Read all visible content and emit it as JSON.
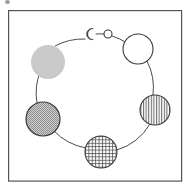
{
  "figure": {
    "background_color": "#ffffff",
    "ink_color": "#3a3a3a",
    "frame": {
      "label": "figure-border",
      "x": 8,
      "y": 10,
      "width": 174,
      "height": 172,
      "stroke": "#555555",
      "stroke_width": 1.2,
      "fill": "none"
    },
    "speck": {
      "label": "scan-artifact-speck",
      "color": "#8a8a8a"
    },
    "ring": {
      "label": "cycle-path",
      "center_x": 95,
      "center_y": 97,
      "radius": 58,
      "stroke": "#4a4a4a",
      "stroke_width": 1.0,
      "fill": "none"
    },
    "patterns": {
      "solid_gray": "#c9c9c9",
      "open_white": "#ffffff",
      "vertical_hatch": "#ffffff",
      "grid_hatch": "#ffffff",
      "fine_checker": "#b0b0b0"
    },
    "nodes": [
      {
        "id": "node-crescent",
        "label": "crescent",
        "fill_style": "crescent",
        "cx": 90,
        "cy": 34,
        "r": 5,
        "angle_deg": 264,
        "stroke": "#3a3a3a",
        "fill": "#ffffff"
      },
      {
        "id": "node-tiny-open",
        "label": "tiny-open-circle",
        "fill_style": "open_white",
        "cx": 108,
        "cy": 34,
        "r": 4,
        "angle_deg": 283,
        "stroke": "#3a3a3a",
        "fill": "#ffffff"
      },
      {
        "id": "node-large-open",
        "label": "large-open-circle",
        "fill_style": "open_white",
        "cx": 138,
        "cy": 49,
        "r": 15,
        "angle_deg": 318,
        "stroke": "#3a3a3a",
        "fill": "#ffffff"
      },
      {
        "id": "node-vertical-hatch",
        "label": "vertical-hatched-circle",
        "fill_style": "vertical_hatch",
        "cx": 155,
        "cy": 110,
        "r": 15,
        "angle_deg": 13,
        "stroke": "#3a3a3a",
        "fill": "#ffffff"
      },
      {
        "id": "node-grid-hatch",
        "label": "grid-hatched-circle",
        "fill_style": "grid_hatch",
        "cx": 101,
        "cy": 152,
        "r": 16,
        "angle_deg": 85,
        "stroke": "#3a3a3a",
        "fill": "#ffffff"
      },
      {
        "id": "node-fine-checker",
        "label": "fine-checkered-gray-circle",
        "fill_style": "fine_checker",
        "cx": 43,
        "cy": 119,
        "r": 17,
        "angle_deg": 142,
        "stroke": "#3a3a3a",
        "fill": "#b0b0b0"
      },
      {
        "id": "node-solid-gray",
        "label": "solid-gray-circle",
        "fill_style": "solid_gray",
        "cx": 48,
        "cy": 62,
        "r": 17,
        "angle_deg": 210,
        "stroke": "none",
        "fill": "#c9c9c9"
      }
    ]
  }
}
